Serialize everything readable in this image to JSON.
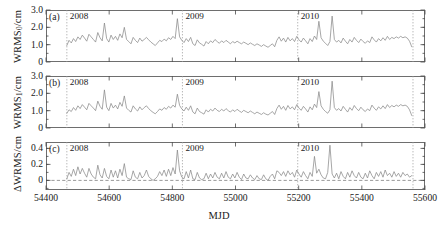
{
  "figure": {
    "xlabel": "MJD",
    "x_ticks": [
      "54400",
      "54600",
      "54800",
      "55000",
      "55200",
      "55400",
      "55600"
    ],
    "year_markers": [
      "2008",
      "2009",
      "2010"
    ],
    "panel_tags": [
      "(a)",
      "(b)",
      "(c)"
    ],
    "line_color": "#8a8a8a",
    "frame_color": "#6e6e6e"
  },
  "chart_data": [
    {
      "type": "line",
      "panel": "(a)",
      "title": "",
      "xlabel": "MJD",
      "ylabel": "WRMS0/cm",
      "ylabel_text": "WRMS",
      "ylabel_sub": "0",
      "ylabel_unit": "/cm",
      "xlim": [
        54400,
        55600
      ],
      "ylim": [
        0,
        3.0
      ],
      "y_ticks": [
        "0",
        "1.0",
        "2.0",
        "3.0"
      ],
      "y_tick_values": [
        0,
        1.0,
        2.0,
        3.0
      ],
      "x_ticks": [
        "54400",
        "54600",
        "54800",
        "55000",
        "55200",
        "55400",
        "55600"
      ],
      "x_tick_values": [
        54400,
        54600,
        54800,
        55000,
        55200,
        55400,
        55600
      ],
      "grid": false,
      "legend": "none",
      "year_lines": [
        54466,
        54832,
        55197,
        55562
      ],
      "year_labels": [
        "2008",
        "2009",
        "2010"
      ],
      "x": [
        54466,
        54473,
        54480,
        54487,
        54494,
        54501,
        54508,
        54515,
        54522,
        54529,
        54536,
        54543,
        54550,
        54557,
        54564,
        54571,
        54578,
        54585,
        54592,
        54599,
        54606,
        54613,
        54620,
        54627,
        54634,
        54641,
        54648,
        54655,
        54662,
        54669,
        54676,
        54683,
        54690,
        54697,
        54704,
        54711,
        54718,
        54725,
        54732,
        54739,
        54746,
        54753,
        54760,
        54767,
        54774,
        54781,
        54788,
        54795,
        54802,
        54809,
        54816,
        54823,
        54830,
        54837,
        54844,
        54851,
        54858,
        54865,
        54872,
        54879,
        54886,
        54893,
        54900,
        54907,
        54914,
        54921,
        54928,
        54935,
        54942,
        54949,
        54956,
        54963,
        54970,
        54977,
        54984,
        54991,
        54998,
        55005,
        55012,
        55019,
        55026,
        55033,
        55040,
        55047,
        55054,
        55061,
        55068,
        55075,
        55082,
        55089,
        55096,
        55103,
        55110,
        55117,
        55124,
        55131,
        55138,
        55145,
        55152,
        55159,
        55166,
        55173,
        55180,
        55187,
        55194,
        55201,
        55208,
        55215,
        55222,
        55229,
        55236,
        55243,
        55250,
        55257,
        55264,
        55271,
        55278,
        55285,
        55292,
        55299,
        55306,
        55313,
        55320,
        55327,
        55334,
        55341,
        55348,
        55355,
        55362,
        55369,
        55376,
        55383,
        55390,
        55397,
        55404,
        55411,
        55418,
        55425,
        55432,
        55439,
        55446,
        55453,
        55460,
        55467,
        55474,
        55481,
        55488,
        55495,
        55502,
        55509,
        55516,
        55523,
        55530,
        55537,
        55544,
        55551,
        55558
      ],
      "y": [
        0.95,
        1.25,
        1.1,
        1.35,
        1.18,
        1.45,
        1.3,
        1.55,
        1.38,
        1.2,
        1.6,
        1.45,
        1.3,
        1.15,
        1.7,
        1.4,
        1.22,
        2.25,
        1.35,
        1.15,
        1.55,
        1.3,
        1.48,
        1.25,
        1.62,
        1.4,
        2.0,
        1.3,
        1.18,
        1.05,
        1.42,
        1.25,
        1.12,
        1.38,
        1.2,
        1.3,
        1.42,
        1.28,
        1.15,
        1.05,
        0.95,
        1.1,
        1.25,
        1.18,
        1.32,
        1.22,
        1.4,
        1.3,
        1.48,
        1.35,
        2.5,
        1.45,
        1.25,
        1.12,
        1.35,
        1.18,
        1.42,
        1.05,
        0.95,
        1.28,
        1.1,
        1.02,
        0.92,
        1.18,
        1.05,
        1.22,
        1.12,
        1.3,
        1.18,
        1.08,
        1.22,
        1.12,
        1.25,
        1.15,
        1.05,
        1.18,
        1.1,
        1.2,
        1.12,
        1.05,
        1.15,
        1.08,
        1.0,
        1.1,
        1.02,
        0.95,
        1.05,
        0.98,
        0.9,
        1.0,
        0.92,
        0.85,
        0.95,
        1.05,
        0.88,
        1.25,
        1.45,
        1.2,
        1.38,
        1.15,
        1.42,
        1.22,
        1.35,
        1.18,
        1.48,
        1.28,
        1.15,
        1.38,
        1.22,
        1.05,
        1.35,
        1.18,
        1.5,
        1.3,
        2.35,
        1.4,
        1.2,
        1.08,
        0.95,
        1.18,
        2.65,
        1.3,
        1.15,
        1.25,
        1.1,
        1.38,
        1.2,
        1.05,
        1.3,
        1.15,
        1.42,
        1.25,
        1.12,
        1.32,
        1.18,
        1.08,
        1.22,
        1.12,
        1.45,
        1.28,
        1.15,
        1.35,
        1.22,
        1.4,
        1.25,
        1.48,
        1.3,
        1.42,
        1.35,
        1.45,
        1.38,
        1.48,
        1.4,
        1.45,
        1.38,
        1.2,
        0.88,
        0.95
      ]
    },
    {
      "type": "line",
      "panel": "(b)",
      "title": "",
      "xlabel": "MJD",
      "ylabel": "WRMS1/cm",
      "ylabel_text": "WRMS",
      "ylabel_sub": "1",
      "ylabel_unit": "/cm",
      "xlim": [
        54400,
        55600
      ],
      "ylim": [
        0,
        3.0
      ],
      "y_ticks": [
        "0",
        "1.0",
        "2.0",
        "3.0"
      ],
      "y_tick_values": [
        0,
        1.0,
        2.0,
        3.0
      ],
      "x_ticks": [
        "54400",
        "54600",
        "54800",
        "55000",
        "55200",
        "55400",
        "55600"
      ],
      "x_tick_values": [
        54400,
        54600,
        54800,
        55000,
        55200,
        55400,
        55600
      ],
      "grid": false,
      "legend": "none",
      "year_lines": [
        54466,
        54832,
        55197,
        55562
      ],
      "year_labels": [
        "2008",
        "2009",
        "2010"
      ],
      "x": [
        54466,
        54473,
        54480,
        54487,
        54494,
        54501,
        54508,
        54515,
        54522,
        54529,
        54536,
        54543,
        54550,
        54557,
        54564,
        54571,
        54578,
        54585,
        54592,
        54599,
        54606,
        54613,
        54620,
        54627,
        54634,
        54641,
        54648,
        54655,
        54662,
        54669,
        54676,
        54683,
        54690,
        54697,
        54704,
        54711,
        54718,
        54725,
        54732,
        54739,
        54746,
        54753,
        54760,
        54767,
        54774,
        54781,
        54788,
        54795,
        54802,
        54809,
        54816,
        54823,
        54830,
        54837,
        54844,
        54851,
        54858,
        54865,
        54872,
        54879,
        54886,
        54893,
        54900,
        54907,
        54914,
        54921,
        54928,
        54935,
        54942,
        54949,
        54956,
        54963,
        54970,
        54977,
        54984,
        54991,
        54998,
        55005,
        55012,
        55019,
        55026,
        55033,
        55040,
        55047,
        55054,
        55061,
        55068,
        55075,
        55082,
        55089,
        55096,
        55103,
        55110,
        55117,
        55124,
        55131,
        55138,
        55145,
        55152,
        55159,
        55166,
        55173,
        55180,
        55187,
        55194,
        55201,
        55208,
        55215,
        55222,
        55229,
        55236,
        55243,
        55250,
        55257,
        55264,
        55271,
        55278,
        55285,
        55292,
        55299,
        55306,
        55313,
        55320,
        55327,
        55334,
        55341,
        55348,
        55355,
        55362,
        55369,
        55376,
        55383,
        55390,
        55397,
        55404,
        55411,
        55418,
        55425,
        55432,
        55439,
        55446,
        55453,
        55460,
        55467,
        55474,
        55481,
        55488,
        55495,
        55502,
        55509,
        55516,
        55523,
        55530,
        55537,
        55544,
        55551,
        55558
      ],
      "y": [
        0.85,
        1.05,
        0.95,
        1.18,
        1.02,
        1.28,
        1.12,
        1.35,
        1.2,
        1.05,
        1.42,
        1.28,
        1.15,
        1.0,
        1.55,
        1.25,
        1.08,
        2.2,
        1.2,
        1.0,
        1.42,
        1.15,
        1.32,
        1.1,
        1.48,
        1.25,
        1.85,
        1.15,
        1.02,
        0.92,
        1.28,
        1.1,
        0.98,
        1.22,
        1.05,
        1.18,
        1.28,
        1.12,
        1.0,
        0.9,
        0.82,
        0.95,
        1.1,
        1.02,
        1.18,
        1.08,
        1.25,
        1.15,
        1.32,
        1.2,
        1.95,
        1.3,
        1.1,
        0.98,
        1.2,
        1.02,
        1.28,
        0.92,
        0.82,
        1.15,
        0.95,
        0.88,
        0.8,
        1.05,
        0.92,
        1.08,
        0.98,
        1.15,
        1.02,
        0.95,
        1.08,
        0.98,
        1.12,
        1.0,
        0.92,
        1.05,
        0.95,
        1.08,
        0.98,
        0.9,
        1.02,
        0.95,
        0.88,
        0.98,
        0.9,
        0.82,
        0.92,
        0.85,
        0.78,
        0.88,
        0.8,
        0.75,
        0.85,
        0.95,
        0.78,
        1.12,
        1.32,
        1.08,
        1.25,
        1.02,
        1.3,
        1.1,
        1.22,
        1.05,
        1.35,
        1.15,
        1.02,
        1.25,
        1.1,
        0.92,
        1.22,
        1.05,
        1.38,
        1.18,
        2.1,
        1.28,
        1.08,
        0.95,
        0.85,
        1.05,
        2.7,
        1.18,
        1.02,
        1.12,
        0.98,
        1.25,
        1.08,
        0.92,
        1.18,
        1.02,
        1.3,
        1.12,
        1.0,
        1.2,
        1.05,
        0.95,
        1.1,
        1.0,
        1.32,
        1.15,
        1.02,
        1.22,
        1.1,
        1.28,
        1.12,
        1.35,
        1.18,
        1.3,
        1.22,
        1.32,
        1.25,
        1.35,
        1.28,
        1.32,
        1.25,
        1.05,
        0.72,
        0.8
      ]
    },
    {
      "type": "line",
      "panel": "(c)",
      "title": "",
      "xlabel": "MJD",
      "ylabel": "ΔWRMS/cm",
      "ylabel_text": "ΔWRMS",
      "ylabel_sub": "",
      "ylabel_unit": "/cm",
      "xlim": [
        54400,
        55600
      ],
      "ylim": [
        -0.12,
        0.48
      ],
      "y_ticks": [
        "0",
        "0.2",
        "0.4"
      ],
      "y_tick_values": [
        0,
        0.2,
        0.4
      ],
      "x_ticks": [
        "54400",
        "54600",
        "54800",
        "55000",
        "55200",
        "55400",
        "55600"
      ],
      "x_tick_values": [
        54400,
        54600,
        54800,
        55000,
        55200,
        55400,
        55600
      ],
      "grid": false,
      "legend": "none",
      "zero_line": 0,
      "year_lines": [
        54466,
        54832,
        55197,
        55562
      ],
      "year_labels": [
        "2008",
        "2009",
        "2010"
      ],
      "x": [
        54466,
        54473,
        54480,
        54487,
        54494,
        54501,
        54508,
        54515,
        54522,
        54529,
        54536,
        54543,
        54550,
        54557,
        54564,
        54571,
        54578,
        54585,
        54592,
        54599,
        54606,
        54613,
        54620,
        54627,
        54634,
        54641,
        54648,
        54655,
        54662,
        54669,
        54676,
        54683,
        54690,
        54697,
        54704,
        54711,
        54718,
        54725,
        54732,
        54739,
        54746,
        54753,
        54760,
        54767,
        54774,
        54781,
        54788,
        54795,
        54802,
        54809,
        54816,
        54823,
        54830,
        54837,
        54844,
        54851,
        54858,
        54865,
        54872,
        54879,
        54886,
        54893,
        54900,
        54907,
        54914,
        54921,
        54928,
        54935,
        54942,
        54949,
        54956,
        54963,
        54970,
        54977,
        54984,
        54991,
        54998,
        55005,
        55012,
        55019,
        55026,
        55033,
        55040,
        55047,
        55054,
        55061,
        55068,
        55075,
        55082,
        55089,
        55096,
        55103,
        55110,
        55117,
        55124,
        55131,
        55138,
        55145,
        55152,
        55159,
        55166,
        55173,
        55180,
        55187,
        55194,
        55201,
        55208,
        55215,
        55222,
        55229,
        55236,
        55243,
        55250,
        55257,
        55264,
        55271,
        55278,
        55285,
        55292,
        55299,
        55306,
        55313,
        55320,
        55327,
        55334,
        55341,
        55348,
        55355,
        55362,
        55369,
        55376,
        55383,
        55390,
        55397,
        55404,
        55411,
        55418,
        55425,
        55432,
        55439,
        55446,
        55453,
        55460,
        55467,
        55474,
        55481,
        55488,
        55495,
        55502,
        55509,
        55516,
        55523,
        55530,
        55537,
        55544,
        55551,
        55558
      ],
      "y": [
        0.02,
        0.1,
        0.05,
        0.14,
        0.06,
        0.17,
        0.08,
        0.15,
        0.09,
        0.04,
        0.15,
        0.08,
        0.04,
        0.02,
        0.19,
        0.07,
        0.03,
        0.15,
        0.05,
        0.02,
        0.13,
        0.04,
        0.12,
        0.03,
        0.14,
        0.06,
        0.21,
        0.04,
        0.02,
        0.01,
        0.12,
        0.04,
        0.02,
        0.1,
        0.03,
        0.06,
        0.13,
        0.05,
        0.02,
        0.0,
        0.02,
        0.05,
        0.11,
        0.06,
        0.13,
        0.05,
        0.14,
        0.06,
        0.16,
        0.08,
        0.38,
        0.12,
        0.04,
        0.02,
        0.11,
        0.03,
        0.13,
        0.02,
        0.01,
        0.1,
        0.03,
        0.01,
        0.02,
        0.09,
        0.02,
        0.08,
        0.03,
        0.1,
        0.04,
        0.02,
        0.09,
        0.03,
        0.11,
        0.04,
        0.02,
        0.08,
        0.03,
        0.1,
        0.04,
        0.01,
        0.08,
        0.03,
        0.02,
        0.07,
        0.03,
        0.01,
        0.06,
        0.02,
        0.01,
        0.07,
        0.02,
        0.0,
        0.05,
        0.08,
        0.02,
        0.12,
        0.1,
        0.06,
        0.11,
        0.05,
        0.12,
        0.07,
        0.1,
        0.04,
        0.13,
        0.08,
        0.04,
        0.11,
        0.06,
        0.02,
        0.1,
        0.05,
        0.3,
        0.09,
        0.14,
        0.07,
        0.03,
        0.02,
        0.1,
        0.44,
        0.08,
        0.03,
        0.09,
        0.02,
        0.11,
        0.05,
        0.02,
        0.1,
        0.04,
        0.12,
        0.06,
        0.03,
        0.1,
        0.04,
        0.02,
        0.09,
        0.03,
        0.12,
        0.06,
        0.02,
        0.1,
        0.05,
        0.11,
        0.04,
        0.13,
        0.06,
        0.09,
        0.04,
        0.11,
        0.05,
        0.09,
        0.04,
        0.1,
        0.06,
        0.08,
        0.04,
        0.06
      ]
    }
  ]
}
